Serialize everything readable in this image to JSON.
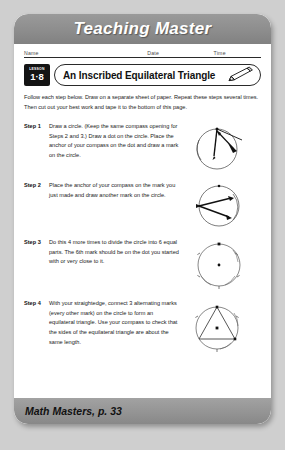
{
  "header": {
    "title": "Teaching Master"
  },
  "namebar": {
    "name_label": "Name",
    "date_label": "Date",
    "time_label": "Time"
  },
  "title_row": {
    "lesson_label": "LESSON",
    "lesson_number": "1·8",
    "title": "An Inscribed Equilateral Triangle",
    "pencil_icon": "pencil-icon"
  },
  "intro": {
    "text": "Follow each step below. Draw on a separate sheet of paper. Repeat these steps several times. Then cut out your best work and tape it to the bottom of this page."
  },
  "steps": [
    {
      "label": "Step 1",
      "text": "Draw a circle. (Keep the same compass opening for Steps 2 and 3.) Draw a dot on the circle. Place the anchor of your compass on the dot and draw a mark on the circle.",
      "figure": "circle-with-compass-first-mark"
    },
    {
      "label": "Step 2",
      "text": "Place the anchor of your compass on the mark you just made and draw another mark on the circle.",
      "figure": "circle-with-compass-second-mark"
    },
    {
      "label": "Step 3",
      "text": "Do this 4 more times to divide the circle into 6 equal parts. The 6th mark should be on the dot you started with or very close to it.",
      "figure": "circle-divided-into-six-parts"
    },
    {
      "label": "Step 4",
      "text": "With your straightedge, connect 3 alternating marks (every other mark) on the circle to form an equilateral triangle. Use your compass to check that the sides of the equilateral triangle are about the same length.",
      "figure": "circle-with-inscribed-equilateral-triangle"
    }
  ],
  "footer": {
    "text": "Math Masters, p. 33"
  },
  "colors": {
    "page_background": "#cfcfcf",
    "sheet": "#ffffff",
    "band_gray": "#909090",
    "badge_black": "#141414",
    "ink": "#1b1b1b"
  }
}
